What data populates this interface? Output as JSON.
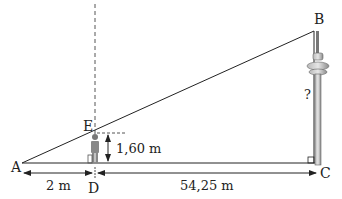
{
  "diagram": {
    "points": {
      "A": "A",
      "B": "B",
      "C": "C",
      "D": "D",
      "E": "E"
    },
    "measures": {
      "AD": "2 m",
      "DC": "54,25 m",
      "DE": "1,60 m",
      "BC": "?"
    },
    "colors": {
      "line": "#222222",
      "tower": "#8a8a8a",
      "person": "#7a7a7a",
      "dashed": "#555555"
    }
  }
}
